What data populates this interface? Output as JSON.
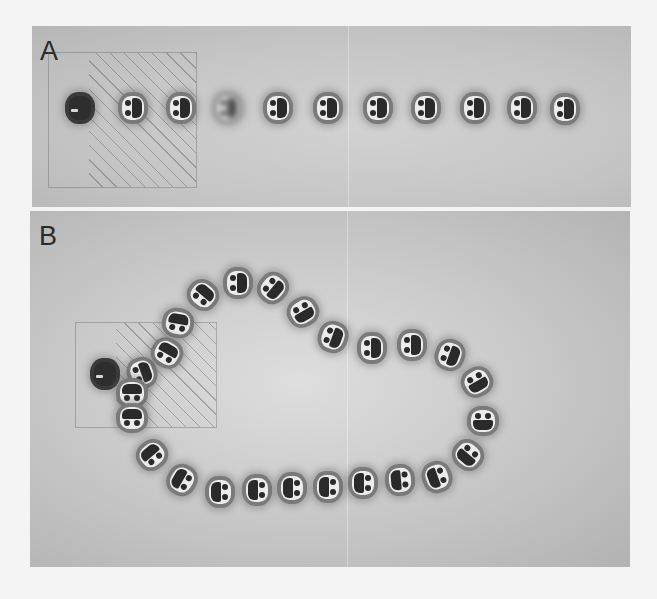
{
  "figure": {
    "panels": [
      {
        "label": "A",
        "description": "Robots arranged in a straight line",
        "robot_count": 11,
        "robots": [
          {
            "x": 80,
            "y": 108,
            "type": "seed",
            "angle": 0
          },
          {
            "x": 133,
            "y": 108,
            "type": "robot",
            "angle": 0
          },
          {
            "x": 181,
            "y": 108,
            "type": "robot",
            "angle": 0
          },
          {
            "x": 228,
            "y": 108,
            "type": "moving",
            "angle": 0
          },
          {
            "x": 278,
            "y": 108,
            "type": "robot",
            "angle": 0
          },
          {
            "x": 328,
            "y": 108,
            "type": "robot",
            "angle": 0
          },
          {
            "x": 378,
            "y": 108,
            "type": "robot",
            "angle": 0
          },
          {
            "x": 426,
            "y": 108,
            "type": "robot",
            "angle": 0
          },
          {
            "x": 475,
            "y": 108,
            "type": "robot",
            "angle": 0
          },
          {
            "x": 522,
            "y": 108,
            "type": "robot",
            "angle": 0
          },
          {
            "x": 565,
            "y": 109,
            "type": "robot",
            "angle": 0
          }
        ]
      },
      {
        "label": "B",
        "description": "Robots arranged in a closed loop shape",
        "robot_count": 31,
        "robots": [
          {
            "x": 105,
            "y": 374,
            "type": "seed",
            "angle": 0
          },
          {
            "x": 142,
            "y": 373,
            "type": "robot",
            "angle": -20
          },
          {
            "x": 132,
            "y": 393,
            "type": "robot",
            "angle": -90
          },
          {
            "x": 132,
            "y": 418,
            "type": "robot",
            "angle": -90
          },
          {
            "x": 152,
            "y": 455,
            "type": "robot",
            "angle": -130
          },
          {
            "x": 182,
            "y": 480,
            "type": "robot",
            "angle": -150
          },
          {
            "x": 220,
            "y": 492,
            "type": "robot",
            "angle": 180
          },
          {
            "x": 257,
            "y": 490,
            "type": "robot",
            "angle": 180
          },
          {
            "x": 292,
            "y": 488,
            "type": "robot",
            "angle": 180
          },
          {
            "x": 328,
            "y": 487,
            "type": "robot",
            "angle": 180
          },
          {
            "x": 363,
            "y": 483,
            "type": "robot",
            "angle": 180
          },
          {
            "x": 400,
            "y": 480,
            "type": "robot",
            "angle": 175
          },
          {
            "x": 437,
            "y": 477,
            "type": "robot",
            "angle": 160
          },
          {
            "x": 468,
            "y": 455,
            "type": "robot",
            "angle": 130
          },
          {
            "x": 483,
            "y": 421,
            "type": "robot",
            "angle": 90
          },
          {
            "x": 477,
            "y": 382,
            "type": "robot",
            "angle": 60
          },
          {
            "x": 450,
            "y": 355,
            "type": "robot",
            "angle": 20
          },
          {
            "x": 412,
            "y": 345,
            "type": "robot",
            "angle": 0
          },
          {
            "x": 372,
            "y": 348,
            "type": "robot",
            "angle": 0
          },
          {
            "x": 333,
            "y": 337,
            "type": "robot",
            "angle": 20
          },
          {
            "x": 303,
            "y": 312,
            "type": "robot",
            "angle": 60
          },
          {
            "x": 273,
            "y": 288,
            "type": "robot",
            "angle": 40
          },
          {
            "x": 238,
            "y": 283,
            "type": "robot",
            "angle": 0
          },
          {
            "x": 203,
            "y": 295,
            "type": "robot",
            "angle": -50
          },
          {
            "x": 178,
            "y": 323,
            "type": "robot",
            "angle": -80
          },
          {
            "x": 167,
            "y": 353,
            "type": "robot",
            "angle": -60
          }
        ]
      }
    ],
    "colors": {
      "page_background": "#f4f4f4",
      "panel_gray": "#c8c8c8",
      "robot_body": "#7a7a7a",
      "robot_face": "#ececec",
      "robot_marker": "#2a2a2a",
      "label_color": "#2a2a2a"
    }
  }
}
